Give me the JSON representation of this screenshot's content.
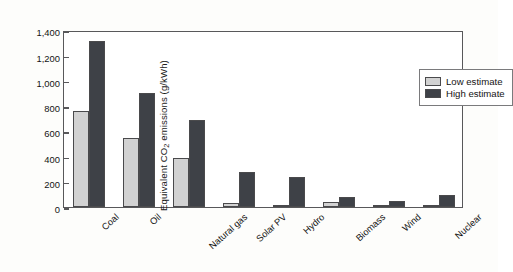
{
  "chart_data": {
    "type": "bar",
    "title": "",
    "xlabel": "",
    "ylabel": "Equivalent CO2 emissions (g/kWh)",
    "ylabel_prefix": "Equivalent CO",
    "ylabel_sub": "2",
    "ylabel_suffix": " emissions (g/kWh)",
    "categories": [
      "Coal",
      "Oil",
      "Natural gas",
      "Solar PV",
      "Hydro",
      "Biomass",
      "Wind",
      "Nuclear"
    ],
    "series": [
      {
        "name": "Low estimate",
        "color": "#d2d2d2",
        "values": [
          760,
          545,
          390,
          30,
          4,
          40,
          8,
          6
        ]
      },
      {
        "name": "High estimate",
        "color": "#3e4147",
        "values": [
          1310,
          900,
          690,
          280,
          240,
          80,
          50,
          95
        ]
      }
    ],
    "ylim": [
      0,
      1400
    ],
    "yticks": [
      0,
      200,
      400,
      600,
      800,
      1000,
      1200,
      1400
    ],
    "ytick_labels": [
      "0",
      "200",
      "400",
      "600",
      "800",
      "1,000",
      "1,200",
      "1,400"
    ],
    "grid": false,
    "legend_position": "top-right",
    "legend": [
      "Low estimate",
      "High estimate"
    ]
  }
}
